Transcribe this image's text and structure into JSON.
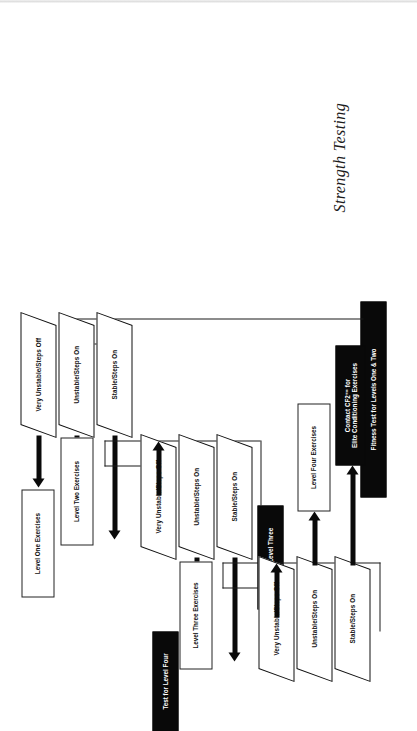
{
  "document": {
    "title": "Strength Testing"
  },
  "flow": {
    "tests": [
      {
        "id": "test-levels-one-two",
        "label": "Fitness Test for Levels One & Two"
      },
      {
        "id": "test-level-three",
        "label": "Test for Level Three"
      },
      {
        "id": "test-level-four",
        "label": "Test for Level Four"
      }
    ],
    "branch_labels": {
      "very_unstable": "Very Unstable/Steps Off",
      "unstable": "Unstable/Steps On",
      "stable": "Stable/Steps On"
    },
    "groups": [
      {
        "id": "group-one-two",
        "test": "Fitness Test for Levels One & Two",
        "branches": [
          {
            "condition": "Very Unstable/Steps Off",
            "outcome": "Level One Exercises",
            "outcome_style": "white-box"
          },
          {
            "condition": "Unstable/Steps On",
            "outcome": "Level Two Exercises",
            "outcome_style": "white-box"
          },
          {
            "condition": "Stable/Steps On",
            "outcome": "Test for Level Three",
            "outcome_style": "black-box"
          }
        ]
      },
      {
        "id": "group-three",
        "test": "Test for Level Three",
        "branches": [
          {
            "condition": "Very Unstable/Steps Off",
            "outcome": "Level Two Exercises",
            "outcome_style": "white-box"
          },
          {
            "condition": "Unstable/Steps On",
            "outcome": "Level Three Exercises",
            "outcome_style": "white-box"
          },
          {
            "condition": "Stable/Steps On",
            "outcome": "Test for Level Four",
            "outcome_style": "black-box"
          }
        ]
      },
      {
        "id": "group-four",
        "test": "Test for Level Four",
        "branches": [
          {
            "condition": "Very Unstable/Steps Off",
            "outcome": "Level Three Exercises",
            "outcome_style": "white-box"
          },
          {
            "condition": "Unstable/Steps On",
            "outcome": "Level Four Exercises",
            "outcome_style": "white-box"
          },
          {
            "condition": "Stable/Steps On",
            "outcome": "Contact CF2™ for Elite Conditioning Exercises",
            "outcome_style": "black-box"
          }
        ]
      }
    ],
    "outcomes": {
      "level_one": "Level One Exercises",
      "level_two": "Level Two Exercises",
      "level_three": "Level Three Exercises",
      "level_four": "Level Four Exercises",
      "elite_line1": "Contact CF2™ for",
      "elite_line2": "Elite Conditioning Exercises"
    }
  },
  "colors": {
    "ink": "#0a0a0a",
    "box_fill": "#ffffff",
    "process_fill": "#090909",
    "process_text": "#ffffff"
  }
}
